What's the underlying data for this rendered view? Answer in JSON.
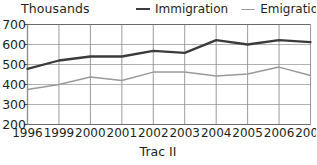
{
  "axis_title": "Thousands",
  "caption": "Trac II",
  "legend": [
    {
      "label": "Immigration",
      "color": "#3b3b3b",
      "key": "immigration"
    },
    {
      "label": "Emigration",
      "color": "#9a9a9a",
      "key": "emigration"
    }
  ],
  "chart_data": {
    "type": "line",
    "title": "Thousands",
    "subtitle": "Trac II",
    "xlabel": "",
    "ylabel": "Thousands",
    "categories": [
      "1996",
      "1999",
      "2000",
      "2001",
      "2002",
      "2003",
      "2004",
      "2005",
      "2006",
      "2007"
    ],
    "series": [
      {
        "name": "Immigration",
        "color": "#3b3b3b",
        "values": [
          478,
          520,
          540,
          540,
          568,
          558,
          622,
          600,
          622,
          612
        ]
      },
      {
        "name": "Emigration",
        "color": "#9a9a9a",
        "values": [
          375,
          400,
          437,
          420,
          462,
          463,
          442,
          453,
          487,
          445
        ]
      }
    ],
    "ylim": [
      200,
      700
    ],
    "yticks": [
      700,
      600,
      500,
      400,
      300,
      200
    ],
    "xticks": [
      "1996",
      "1999",
      "2000",
      "2001",
      "2002",
      "2003",
      "2004",
      "2005",
      "2006",
      "2007"
    ],
    "grid": true,
    "legend_position": "top-right"
  }
}
